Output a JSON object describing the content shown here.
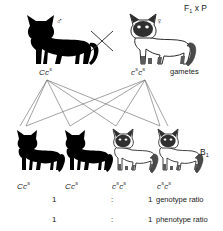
{
  "diagram": {
    "title_label": "F1 x P",
    "stage_generation_label": "F₁ x P",
    "gametes_label": "gametes",
    "offspring_generation_label": "B₁"
  },
  "parents": {
    "male": {
      "sex_symbol": "♂",
      "phenotype": "black",
      "genotype_C": "Cc",
      "genotype_sup": "s",
      "genotype_full": "Ccˢ"
    },
    "female": {
      "sex_symbol": "♀",
      "phenotype": "siamese",
      "genotype_full": "cˢcˢ"
    },
    "cross_symbol": "x"
  },
  "gametes_row": {
    "left_genotype": {
      "base1": "C",
      "base2": "c",
      "sup2": "s"
    },
    "right_genotype": {
      "base1": "c",
      "sup1": "s",
      "base2": "c",
      "sup2": "s"
    }
  },
  "offspring": [
    {
      "phenotype": "black",
      "base1": "C",
      "sup1": "",
      "base2": "c",
      "sup2": "s"
    },
    {
      "phenotype": "black",
      "base1": "C",
      "sup1": "",
      "base2": "c",
      "sup2": "s"
    },
    {
      "phenotype": "siamese",
      "base1": "c",
      "sup1": "s",
      "base2": "c",
      "sup2": "s"
    },
    {
      "phenotype": "siamese",
      "base1": "c",
      "sup1": "s",
      "base2": "c",
      "sup2": "s"
    }
  ],
  "ratios": [
    {
      "left": "1",
      "colon": ":",
      "right": "1",
      "text": "genotype ratio"
    },
    {
      "left": "1",
      "colon": ":",
      "right": "1",
      "text": "phenotype ratio"
    }
  ],
  "colors": {
    "black_cat": "#000000",
    "siamese_body": "#ffffff",
    "siamese_outline": "#2b2b2b",
    "siamese_points": "#4a4a4a",
    "line": "#6e6e6e",
    "text": "#1a1a1a",
    "background": "#ffffff"
  }
}
